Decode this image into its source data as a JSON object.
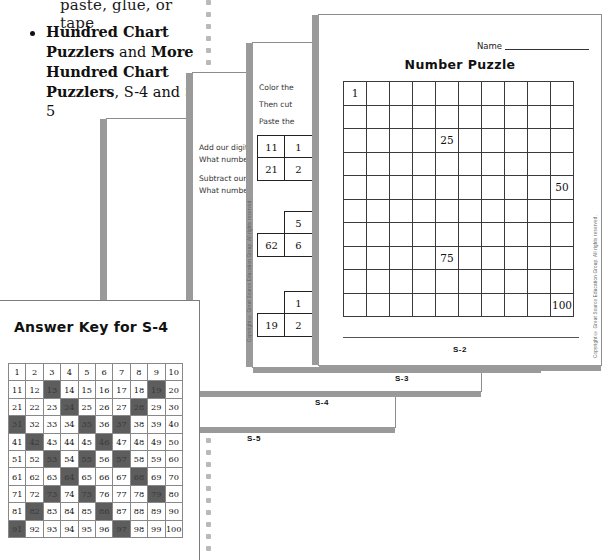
{
  "left_column": {
    "fragment_top": "paste, glue, or tape",
    "bullet": {
      "bold1": "Hundred Chart Puzzlers",
      "mid": " and ",
      "bold2": "More Hundred Chart Puzzlers",
      "tail": ", S-4 and S-5"
    }
  },
  "sheets": {
    "s2": {
      "code": "S-2",
      "name_label": "Name",
      "title": "Number Puzzle",
      "copyright": "Copyright © Great Source Education Group. All rights reserved.",
      "grid": {
        "rows": 10,
        "cols": 10,
        "filled": [
          {
            "row": 1,
            "col": 1,
            "value": "1"
          },
          {
            "row": 3,
            "col": 5,
            "value": "25"
          },
          {
            "row": 5,
            "col": 10,
            "value": "50"
          },
          {
            "row": 8,
            "col": 5,
            "value": "75"
          },
          {
            "row": 10,
            "col": 10,
            "value": "100"
          }
        ]
      }
    },
    "s3": {
      "code": "S-3",
      "copyright": "Copyright © Great Source Education Group. All rights reserved.",
      "lines": [
        "Color the",
        "Then cut",
        "Paste the"
      ],
      "minicells": [
        "11",
        "1",
        "21",
        "2",
        "5",
        "62",
        "6",
        "1",
        "19",
        "2"
      ]
    },
    "s4": {
      "code": "S-4",
      "lines": [
        "Add our digits",
        "What number",
        "Subtract our c",
        "What number"
      ]
    },
    "s5": {
      "code": "S-5",
      "lines": [
        "Follow the",
        "Find each",
        "Color eac",
        "A. Start",
        "B. Add",
        "C. Add",
        "D. Add",
        "E. Add",
        "F. Subt",
        "G. Subt"
      ],
      "footer_line": "Do you see a"
    }
  },
  "answer_key": {
    "title": "Answer Key for S-4",
    "grid": {
      "rows": 10,
      "cols": 10,
      "start": 1,
      "highlighted": [
        13,
        19,
        24,
        28,
        31,
        35,
        37,
        42,
        46,
        53,
        55,
        57,
        64,
        68,
        73,
        75,
        79,
        82,
        86,
        91,
        97
      ]
    }
  },
  "colors": {
    "highlight": "#5d5d5d",
    "paper_edge": "#9a9a9a",
    "dot_rule": "#b9b9b9",
    "ink": "#111111"
  }
}
